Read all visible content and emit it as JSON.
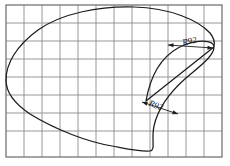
{
  "drawing": {
    "title": "Cam profile outline on grid",
    "background_color": "#ffffff",
    "curve_color": "#1c1c1c",
    "grid_color": "#8d8d8d",
    "grid_border_color": "#6f6f6f"
  },
  "grid": {
    "left": 6,
    "top": 5,
    "right": 222,
    "bottom": 157,
    "cell_size": 18,
    "columns": 12,
    "rows": 8,
    "visible": true
  },
  "dimensions": [
    {
      "id": "upper-radius",
      "label": "R92",
      "rotation_deg": -12,
      "text_x": 190,
      "text_y": 44,
      "leader_start_x": 168,
      "leader_start_y": 45,
      "leader_end_x": 213,
      "leader_end_y": 48
    },
    {
      "id": "inner-radius",
      "label": "R92",
      "rotation_deg": 20,
      "text_x": 155,
      "text_y": 108,
      "leader_start_x": 178,
      "leader_start_y": 114,
      "leader_end_x": 142,
      "leader_end_y": 102
    }
  ],
  "chart_data": {
    "type": "line",
    "xlabel": "",
    "ylabel": "",
    "xlim": [
      6,
      222
    ],
    "ylim": [
      5,
      157
    ],
    "grid": true,
    "legend": "none",
    "annotations": [
      "R92",
      "R92"
    ],
    "series": [
      {
        "name": "outer-profile",
        "closed": true,
        "path": "M 146 101 C 150 78, 160 58, 178 48 C 196 38, 214 40, 214 47 C 214 56, 200 66, 186 78 C 170 92, 158 108, 154 126 C 151 140, 156 150, 150 151 C 141 152, 128 149, 112 146 C 88 142, 56 130, 30 114 C 12 102, 6 90, 6 80 C 6 64, 16 46, 38 30 C 62 13, 100 6, 134 7 C 170 8, 198 20, 210 33 C 214 38, 215 43, 214 47"
      }
    ]
  }
}
